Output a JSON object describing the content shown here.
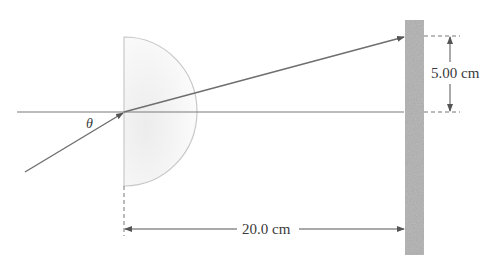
{
  "diagram": {
    "type": "optics-refraction",
    "labels": {
      "angle": "θ",
      "vertical_distance": "5.00 cm",
      "horizontal_distance": "20.0 cm"
    },
    "colors": {
      "ray": "#6e6e6e",
      "axis": "#7a7a7a",
      "lens_outline": "#c8c8c8",
      "lens_fill": "#f3f3f3",
      "screen": "#a9a9a9",
      "dimension": "#555555"
    }
  }
}
